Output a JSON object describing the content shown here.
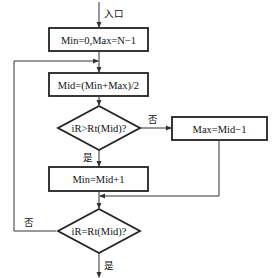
{
  "flowchart": {
    "entry_label": "入口",
    "nodes": {
      "init": {
        "type": "process",
        "text": "Min=0,Max=N−1"
      },
      "mid": {
        "type": "process",
        "text": "Mid=(Min+Max)/2"
      },
      "cmp_gt": {
        "type": "decision",
        "text": "iR>Rt(Mid)?"
      },
      "set_max": {
        "type": "process",
        "text": "Max=Mid−1"
      },
      "set_min": {
        "type": "process",
        "text": "Min=Mid+1"
      },
      "cmp_eq": {
        "type": "decision",
        "text": "iR=Rt(Mid)?"
      }
    },
    "edges": {
      "gt_no": "否",
      "gt_yes": "是",
      "eq_no": "否",
      "eq_yes": "是"
    }
  }
}
